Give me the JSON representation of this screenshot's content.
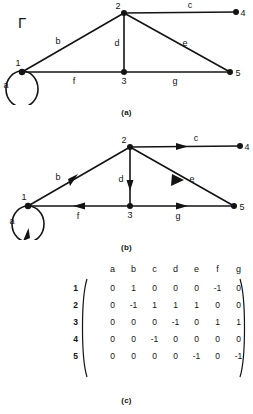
{
  "figure": {
    "graph_symbol": "Γ",
    "matrix_symbol": "A",
    "matrix_subscript": "Γ",
    "caption_a": "(a)",
    "caption_b": "(b)",
    "caption_c": "(c)"
  },
  "graph": {
    "nodes": [
      {
        "id": "1",
        "label": "1",
        "x": 22,
        "y": 72
      },
      {
        "id": "2",
        "label": "2",
        "x": 124,
        "y": 13
      },
      {
        "id": "3",
        "label": "3",
        "x": 124,
        "y": 72
      },
      {
        "id": "4",
        "label": "4",
        "x": 236,
        "y": 12
      },
      {
        "id": "5",
        "label": "5",
        "x": 230,
        "y": 72
      }
    ],
    "edges": [
      {
        "id": "a",
        "label": "a",
        "from": "1",
        "to": "1",
        "kind": "self-loop",
        "label_x": 6,
        "label_y": 88
      },
      {
        "id": "b",
        "label": "b",
        "from": "1",
        "to": "2",
        "kind": "line",
        "label_x": 58,
        "label_y": 44
      },
      {
        "id": "c",
        "label": "c",
        "from": "2",
        "to": "4",
        "kind": "line",
        "label_x": 190,
        "label_y": 8
      },
      {
        "id": "d",
        "label": "d",
        "from": "2",
        "to": "3",
        "kind": "line",
        "label_x": 117,
        "label_y": 46
      },
      {
        "id": "e",
        "label": "e",
        "from": "2",
        "to": "5",
        "kind": "line",
        "label_x": 185,
        "label_y": 46
      },
      {
        "id": "f",
        "label": "f",
        "from": "3",
        "to": "1",
        "kind": "line",
        "label_x": 74,
        "label_y": 84
      },
      {
        "id": "g",
        "label": "g",
        "from": "3",
        "to": "5",
        "kind": "line",
        "label_x": 175,
        "label_y": 84
      }
    ]
  },
  "matrix": {
    "col_headers": [
      "a",
      "b",
      "c",
      "d",
      "e",
      "f",
      "g"
    ],
    "row_headers": [
      "1",
      "2",
      "3",
      "4",
      "5"
    ],
    "rows": [
      [
        "0",
        "1",
        "0",
        "0",
        "0",
        "-1",
        "0"
      ],
      [
        "0",
        "-1",
        "1",
        "1",
        "1",
        "0",
        "0"
      ],
      [
        "0",
        "0",
        "0",
        "-1",
        "0",
        "1",
        "1"
      ],
      [
        "0",
        "0",
        "-1",
        "0",
        "0",
        "0",
        "0"
      ],
      [
        "0",
        "0",
        "0",
        "0",
        "-1",
        "0",
        "-1"
      ]
    ]
  }
}
